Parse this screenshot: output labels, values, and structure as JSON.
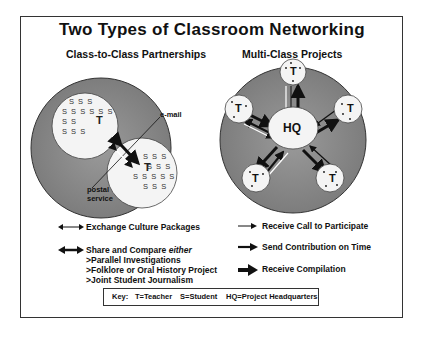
{
  "title": "Two Types of Classroom Networking",
  "left_panel": {
    "heading": "Class-to-Class Partnerships",
    "class_a": {
      "rows": [
        "S S S",
        "S S S S S S",
        "S S",
        "S S S"
      ],
      "teacher": "T"
    },
    "class_b": {
      "rows": [
        "S S S",
        "S S S",
        "S S S S S",
        "S S S"
      ],
      "teacher": "T"
    },
    "labels": {
      "email": "e-mail",
      "postal": "postal",
      "postal_2": "service"
    }
  },
  "right_panel": {
    "heading": "Multi-Class Projects",
    "hub_label": "HQ",
    "node_label": "T",
    "node_count": 5
  },
  "legend": {
    "left": [
      {
        "icon": "thin-double-arrow",
        "label": "Exchange Culture Packages"
      },
      {
        "icon": "thick-double-arrow",
        "label": "Share and Compare",
        "label_emphasis": "either",
        "sub_items": [
          ">Parallel Investigations",
          ">Folklore or Oral History Project",
          ">Joint Student Journalism"
        ]
      }
    ],
    "right": [
      {
        "icon": "thin-arrow",
        "label": "Receive Call to Participate"
      },
      {
        "icon": "medium-arrow",
        "label": "Send Contribution on Time"
      },
      {
        "icon": "thick-arrow",
        "label": "Receive Compilation"
      }
    ]
  },
  "key": {
    "label": "Key:",
    "items": [
      "T=Teacher",
      "S=Student",
      "HQ=Project Headquarters"
    ]
  },
  "colors": {
    "circle_fill": "#8a8a8a",
    "node_fill": "#f4f4f4",
    "ink": "#111111"
  }
}
